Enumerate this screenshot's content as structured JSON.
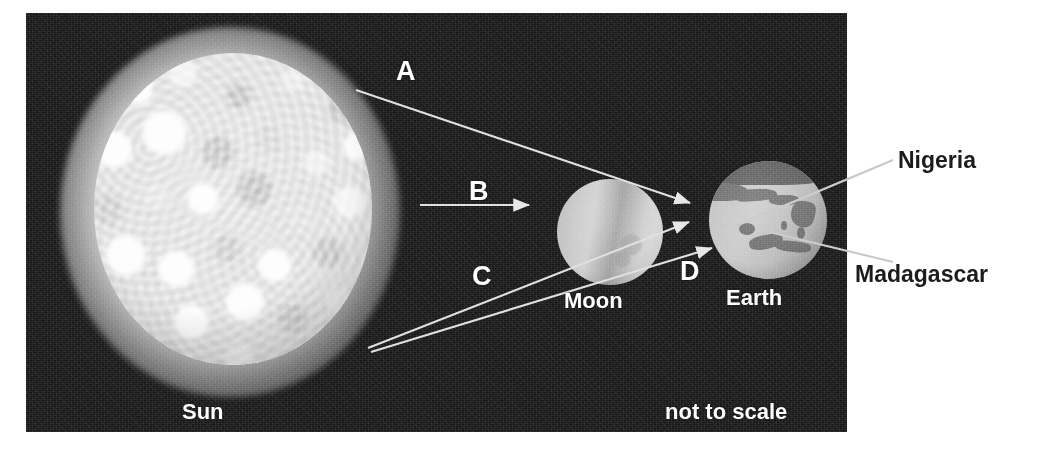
{
  "figure": {
    "type": "labelled-astronomy-diagram",
    "caption_note": "not to scale",
    "background_panel_color": "#161616",
    "label_color_on_dark": "#ffffff",
    "label_color_on_light": "#1c1c1c"
  },
  "bodies": [
    {
      "id": "sun",
      "name": "Sun",
      "caption": "Sun"
    },
    {
      "id": "moon",
      "name": "Moon",
      "caption": "Moon"
    },
    {
      "id": "earth",
      "name": "Earth",
      "caption": "Earth"
    }
  ],
  "letter_labels": [
    {
      "id": "A",
      "text": "A",
      "points_to": "earth"
    },
    {
      "id": "B",
      "text": "B",
      "points_to": "moon"
    },
    {
      "id": "C",
      "text": "C",
      "points_to": "earth"
    },
    {
      "id": "D",
      "text": "D",
      "points_to": "earth"
    }
  ],
  "callouts": [
    {
      "id": "nigeria",
      "text": "Nigeria",
      "points_to": "earth"
    },
    {
      "id": "madagascar",
      "text": "Madagascar",
      "points_to": "earth"
    }
  ],
  "notes": {
    "scale": "not to scale"
  }
}
